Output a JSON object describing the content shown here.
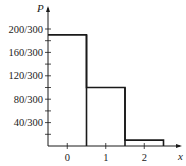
{
  "chart_data": {
    "type": "bar",
    "title": "",
    "xlabel": "x",
    "ylabel": "P",
    "categories": [
      "0",
      "1",
      "2"
    ],
    "values": [
      190,
      100,
      10
    ],
    "value_labels": [
      "190/300",
      "100/300",
      "10/300"
    ],
    "denominator": 300,
    "ylim": [
      0,
      210
    ],
    "yticks_major": [
      40,
      80,
      120,
      160,
      200
    ],
    "ytick_labels": [
      "40/300",
      "80/300",
      "120/300",
      "160/300",
      "200/300"
    ],
    "yticks_minor_step": 20,
    "xticks": [
      0,
      1,
      2
    ],
    "xtick_labels": [
      "0",
      "1",
      "2"
    ],
    "bar_edges": [
      -0.5,
      0.5,
      1.5,
      2.5
    ],
    "grid": false,
    "legend": null,
    "style": "step histogram outline, black lines, no fill"
  },
  "colors": {
    "line": "#1a1a1a",
    "text": "#222222",
    "background": "#ffffff"
  }
}
